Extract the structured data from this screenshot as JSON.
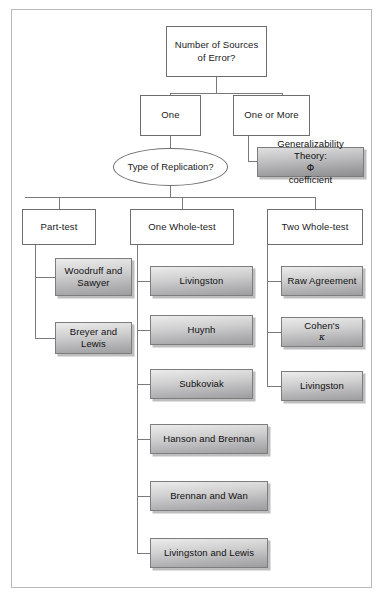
{
  "diagram": {
    "title_node": {
      "line1": "Number of Sources",
      "line2": "of Error?"
    },
    "branch_one": "One",
    "branch_one_or_more": "One or More",
    "decision": {
      "line1": "Type of",
      "line2": "Replication?"
    },
    "generalizability": {
      "line1": "Generalizability Theory:",
      "symbol": "Φ",
      "line2_suffix": " coefficient"
    },
    "columns": [
      {
        "header": "Part-test",
        "items": [
          {
            "line1": "Woodruff and",
            "line2": "Sawyer"
          },
          {
            "line1": "Breyer and Lewis"
          }
        ]
      },
      {
        "header": "One Whole-test",
        "items": [
          {
            "line1": "Livingston"
          },
          {
            "line1": "Huynh"
          },
          {
            "line1": "Subkoviak"
          },
          {
            "line1": "Hanson and Brennan"
          },
          {
            "line1": "Brennan and Wan"
          },
          {
            "line1": "Livingston and Lewis"
          }
        ]
      },
      {
        "header": "Two Whole-test",
        "items": [
          {
            "line1": "Raw Agreement"
          },
          {
            "line1": "Cohen's ",
            "symbol": "κ"
          },
          {
            "line1": "Livingston"
          }
        ]
      }
    ]
  },
  "colors": {
    "frame_border": "#b9b9b9",
    "node_border": "#6d6d6d",
    "line": "#7a7a7a",
    "leaf_light": "#ececed",
    "leaf_dark": "#9d9d9f",
    "text": "#1a1a1a"
  }
}
